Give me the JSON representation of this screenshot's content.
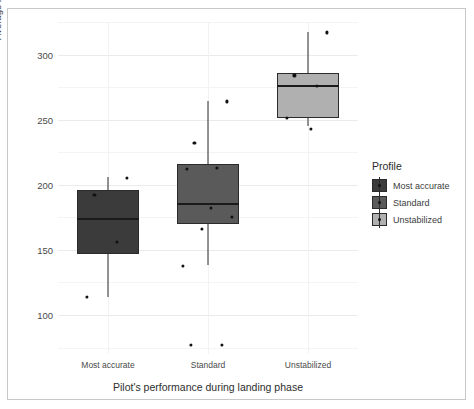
{
  "chart_data": {
    "type": "boxplot",
    "title": "",
    "xlabel": "Pilot's performance during landing phase",
    "ylabel": "Average fixation time on any cockpit instrument (ms)",
    "categories": [
      "Most accurate",
      "Standard",
      "Unstabilized"
    ],
    "ylim": [
      70,
      325
    ],
    "yticks": [
      100,
      150,
      200,
      250,
      300
    ],
    "ytick_labels": [
      "100",
      "150",
      "200",
      "250",
      "300"
    ],
    "grid": true,
    "legend": {
      "title": "Profile",
      "position": "right",
      "entries": [
        {
          "label": "Most accurate",
          "color": "#3b3b3b"
        },
        {
          "label": "Standard",
          "color": "#5a5a5a"
        },
        {
          "label": "Unstabilized",
          "color": "#b0b0b0"
        }
      ]
    },
    "boxes": [
      {
        "category": "Most accurate",
        "color": "#3b3b3b",
        "lower_whisker": 114,
        "q1": 147,
        "median": 174,
        "q3": 196,
        "upper_whisker": 206,
        "points": [
          205,
          192,
          156,
          114
        ]
      },
      {
        "category": "Standard",
        "color": "#5a5a5a",
        "lower_whisker": 138,
        "q1": 170,
        "median": 185,
        "q3": 216,
        "upper_whisker": 264,
        "points": [
          264,
          232,
          213,
          212,
          182,
          175,
          166,
          138,
          77,
          77
        ]
      },
      {
        "category": "Unstabilized",
        "color": "#b0b0b0",
        "lower_whisker": 245,
        "q1": 251,
        "median": 276,
        "q3": 286,
        "upper_whisker": 317,
        "points": [
          317,
          284,
          276,
          251,
          243
        ]
      }
    ]
  }
}
